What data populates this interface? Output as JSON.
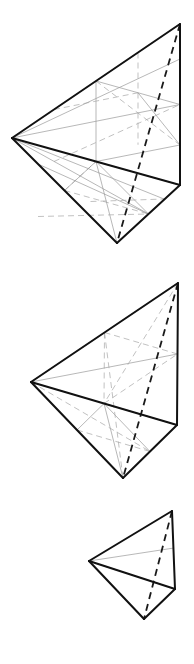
{
  "figure": {
    "background_color": "#ffffff",
    "colors": {
      "solid_edge": "#111111",
      "hidden_edge": "#1a1a1a",
      "construction_line": "#9a9a9a",
      "construction_line_dashed": "#a6a6a6"
    },
    "stroke_widths": {
      "solid_edge": 2.0,
      "hidden_edge": 1.8,
      "construction_line": 0.7,
      "construction_line_dashed": 0.7
    },
    "dash_patterns": {
      "hidden_edge": "7,5",
      "construction_line_dashed": "6,4"
    },
    "panels": [
      {
        "id": "panel-large",
        "label": "Large tetrahedron, subdivision level 2",
        "subdivision_level": 2,
        "vertices": {
          "apex_top_right": [
            180,
            24
          ],
          "left": [
            12,
            138
          ],
          "right_lower": [
            180,
            185
          ],
          "bottom": [
            117,
            243
          ]
        },
        "outline_edges": [
          [
            "left",
            "apex_top_right"
          ],
          [
            "apex_top_right",
            "right_lower"
          ],
          [
            "left",
            "right_lower"
          ],
          [
            "left",
            "bottom"
          ],
          [
            "bottom",
            "right_lower"
          ]
        ],
        "hidden_edges": [
          [
            "apex_top_right",
            "bottom"
          ]
        ]
      },
      {
        "id": "panel-medium",
        "label": "Medium tetrahedron, subdivision level 1",
        "subdivision_level": 1,
        "vertices": {
          "apex_top_right": [
            178,
            283
          ],
          "left": [
            31,
            382
          ],
          "right_lower": [
            177,
            425
          ],
          "bottom": [
            123,
            478
          ]
        },
        "outline_edges": [
          [
            "left",
            "apex_top_right"
          ],
          [
            "apex_top_right",
            "right_lower"
          ],
          [
            "left",
            "right_lower"
          ],
          [
            "left",
            "bottom"
          ],
          [
            "bottom",
            "right_lower"
          ]
        ],
        "hidden_edges": [
          [
            "apex_top_right",
            "bottom"
          ]
        ]
      },
      {
        "id": "panel-small",
        "label": "Small tetrahedron, subdivision level 0",
        "subdivision_level": 0,
        "vertices": {
          "apex_top_right": [
            172,
            511
          ],
          "left": [
            89,
            561
          ],
          "right_lower": [
            175,
            589
          ],
          "bottom": [
            144,
            619
          ]
        },
        "outline_edges": [
          [
            "left",
            "apex_top_right"
          ],
          [
            "apex_top_right",
            "right_lower"
          ],
          [
            "left",
            "right_lower"
          ],
          [
            "left",
            "bottom"
          ],
          [
            "bottom",
            "right_lower"
          ]
        ],
        "hidden_edges": [
          [
            "apex_top_right",
            "bottom"
          ]
        ]
      }
    ]
  }
}
